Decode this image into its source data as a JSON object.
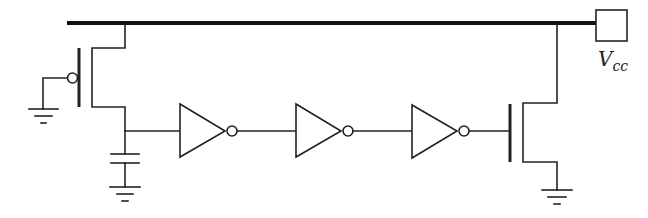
{
  "diagram": {
    "type": "circuit-schematic",
    "supply": {
      "label_main": "V",
      "label_sub": "cc"
    },
    "components": [
      {
        "kind": "pmos-transistor",
        "gate": "ground"
      },
      {
        "kind": "capacitor",
        "to": "ground"
      },
      {
        "kind": "inverter",
        "index": 1
      },
      {
        "kind": "inverter",
        "index": 2
      },
      {
        "kind": "inverter",
        "index": 3
      },
      {
        "kind": "nmos-transistor",
        "source": "ground"
      }
    ],
    "colors": {
      "line": "#222222",
      "background": "#ffffff"
    }
  }
}
